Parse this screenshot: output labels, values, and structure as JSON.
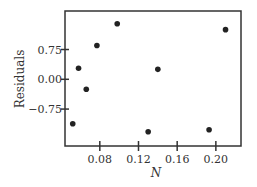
{
  "chart_data": {
    "type": "scatter",
    "title": "",
    "xlabel": "N",
    "ylabel": "Residuals",
    "xlim": [
      0.044,
      0.226
    ],
    "ylim": [
      -1.68,
      1.72
    ],
    "x_ticks": [
      0.08,
      0.12,
      0.16,
      0.2
    ],
    "x_tick_labels": [
      "0.08",
      "0.12",
      "0.16",
      "0.20"
    ],
    "y_ticks": [
      0.75,
      0.0,
      -0.75
    ],
    "y_tick_labels": [
      "0.75",
      "0.00",
      "−0.75"
    ],
    "grid": false,
    "legend": null,
    "points": [
      {
        "x": 0.052,
        "y": -1.12
      },
      {
        "x": 0.058,
        "y": 0.28
      },
      {
        "x": 0.066,
        "y": -0.25
      },
      {
        "x": 0.077,
        "y": 0.85
      },
      {
        "x": 0.098,
        "y": 1.4
      },
      {
        "x": 0.13,
        "y": -1.32
      },
      {
        "x": 0.14,
        "y": 0.25
      },
      {
        "x": 0.193,
        "y": -1.27
      },
      {
        "x": 0.21,
        "y": 1.25
      }
    ],
    "colors": {
      "axis": "#333333",
      "marker": "#222222"
    }
  }
}
